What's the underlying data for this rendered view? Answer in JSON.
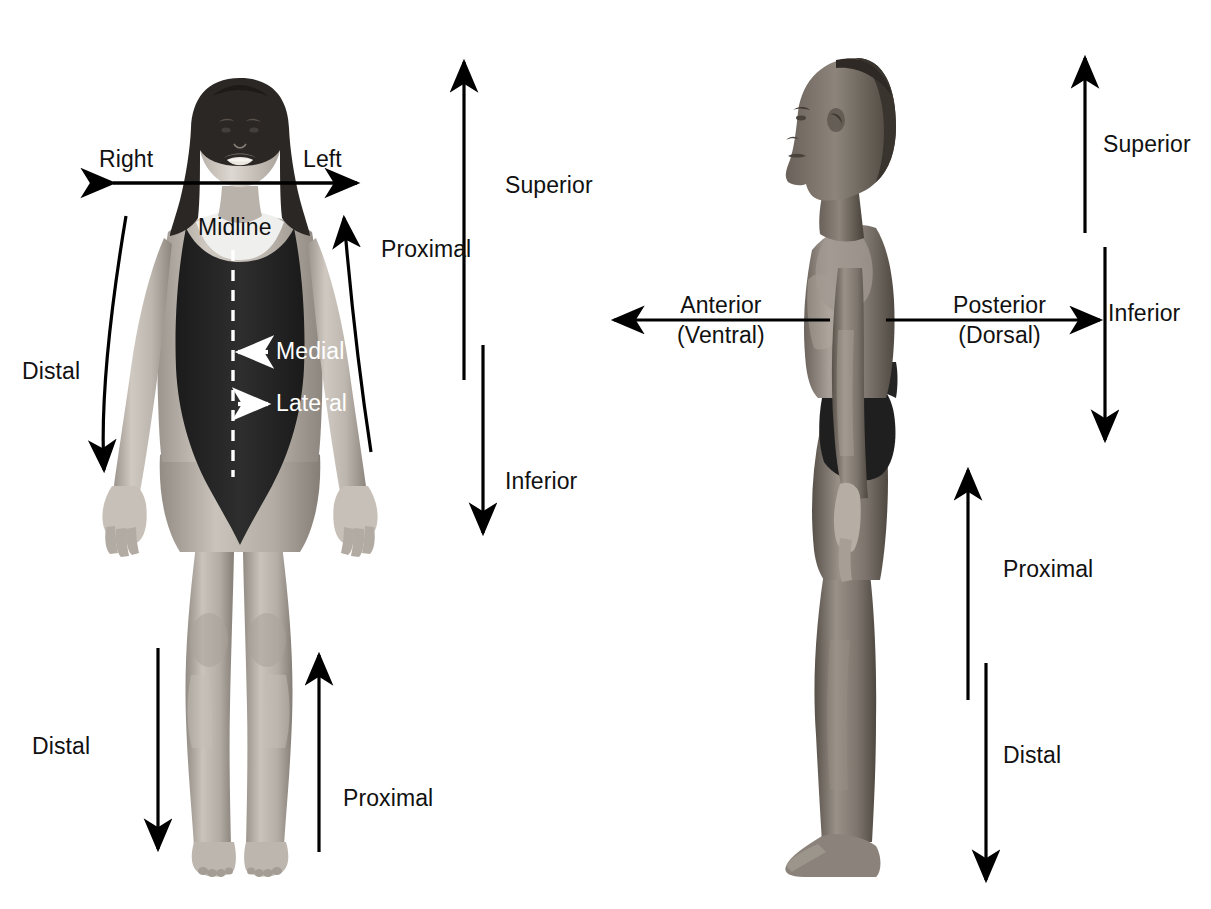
{
  "figure": {
    "background_color": "#ffffff",
    "text_color": "#111111",
    "panels": [
      {
        "id": "anterior-view",
        "view_name": "anterior-view-female",
        "description": "Anterior (front) view of a standing female figure in a dark one-piece swimsuit"
      },
      {
        "id": "lateral-view",
        "view_name": "lateral-view-male",
        "description": "Lateral (side) view of a standing male figure in dark briefs, facing left"
      }
    ]
  },
  "left_panel": {
    "right_label": "Right",
    "left_label": "Left",
    "midline_label": "Midline",
    "medial_label": "Medial",
    "lateral_label": "Lateral",
    "distal_arm_label": "Distal",
    "proximal_arm_label": "Proximal",
    "superior_label": "Superior",
    "inferior_label": "Inferior",
    "distal_leg_label": "Distal",
    "proximal_leg_label": "Proximal"
  },
  "right_panel": {
    "anterior_label": "Anterior",
    "ventral_label": "(Ventral)",
    "posterior_label": "Posterior",
    "dorsal_label": "(Dorsal)",
    "superior_label": "Superior",
    "inferior_label": "Inferior",
    "proximal_label": "Proximal",
    "distal_label": "Distal"
  },
  "colors": {
    "arrow": "#000000",
    "midline_dash": "#ffffff",
    "swimsuit": "#242424",
    "skin_light": "#d8d3cd",
    "skin_mid": "#b9b2aa",
    "skin_dark": "#8f8880",
    "hair": "#2b2724",
    "skin_male_light": "#a09890",
    "skin_male_mid": "#837b73",
    "skin_male_dark": "#5f584f"
  }
}
